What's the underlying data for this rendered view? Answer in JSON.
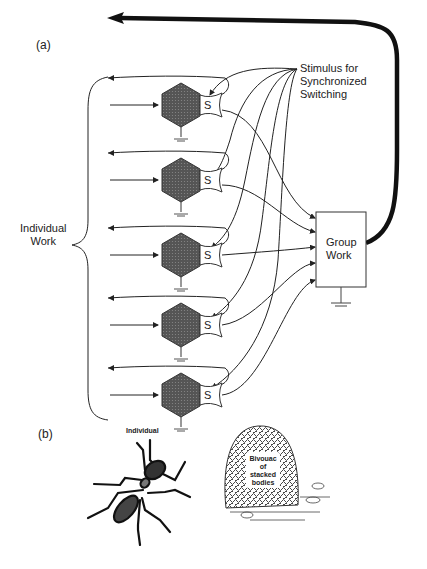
{
  "panel_a": {
    "label": "(a)",
    "stimulus_label_line1": "Stimulus for",
    "stimulus_label_line2": "Synchronized",
    "stimulus_label_line3": "Switching",
    "individual_work_line1": "Individual",
    "individual_work_line2": "Work",
    "group_work_line1": "Group",
    "group_work_line2": "Work",
    "switch_label": "S",
    "nodes": [
      {
        "id": 1,
        "cy": 105
      },
      {
        "id": 2,
        "cy": 180
      },
      {
        "id": 3,
        "cy": 255
      },
      {
        "id": 4,
        "cy": 325
      },
      {
        "id": 5,
        "cy": 395
      }
    ]
  },
  "panel_b": {
    "label": "(b)",
    "individual_caption": "Individual",
    "bivouac_line1": "Bivouac",
    "bivouac_line2": "of",
    "bivouac_line3": "stacked",
    "bivouac_line4": "bodies"
  },
  "colors": {
    "node_fill": "#5a5a5a",
    "line": "#222222",
    "background": "#ffffff"
  }
}
